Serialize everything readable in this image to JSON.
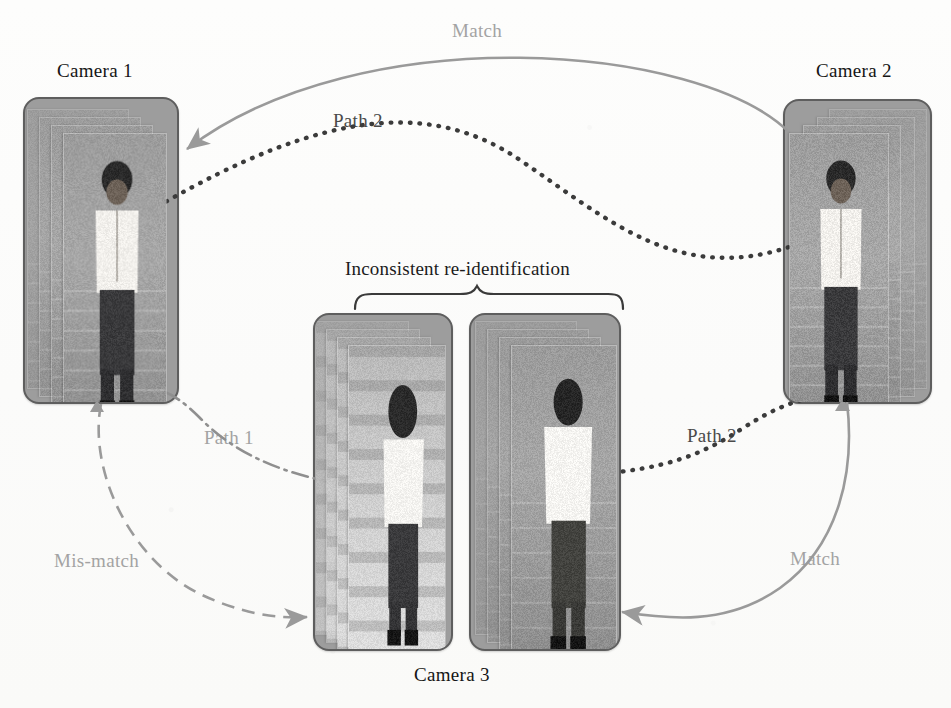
{
  "figure": {
    "background_color": "#fdfdfc"
  },
  "cameras": [
    {
      "id": "camera-1",
      "label": "Camera 1",
      "label_pos": "above",
      "frame_count": 4,
      "subject": "man in white shirt, frontal view"
    },
    {
      "id": "camera-2",
      "label": "Camera 2",
      "label_pos": "above",
      "frame_count": 4,
      "subject": "man in white shirt, frontal view"
    },
    {
      "id": "camera-3",
      "label": "Camera 3",
      "label_pos": "below",
      "frame_count": 4,
      "subject": "two tracklets: woman rear view and man rear view"
    }
  ],
  "panels": [
    {
      "name": "camera-1-panel",
      "camera": "Camera 1"
    },
    {
      "name": "camera-2-panel",
      "camera": "Camera 2"
    },
    {
      "name": "camera-3-panel-a",
      "camera": "Camera 3"
    },
    {
      "name": "camera-3-panel-b",
      "camera": "Camera 3"
    }
  ],
  "annotations": {
    "brace_label": "Inconsistent re-identification",
    "edges": [
      {
        "name": "match-top",
        "label": "Match",
        "style": "solid",
        "color": "#9a9a9a",
        "from": "Camera 2",
        "to": "Camera 1"
      },
      {
        "name": "path2-top",
        "label": "Path 2",
        "style": "dotted",
        "color": "#3b3b3b",
        "from": "Camera 1",
        "to": "Camera 2"
      },
      {
        "name": "path1",
        "label": "Path 1",
        "style": "dash-dot",
        "color": "#8f8f8f",
        "from": "Camera 3 (a)",
        "to": "Camera 1"
      },
      {
        "name": "mis-match",
        "label": "Mis-match",
        "style": "dashed",
        "color": "#9a9a9a",
        "from": "Camera 1",
        "to": "Camera 3 (a)"
      },
      {
        "name": "path2-bottom",
        "label": "Path 2",
        "style": "dotted",
        "color": "#3b3b3b",
        "from": "Camera 3 (b)",
        "to": "Camera 2"
      },
      {
        "name": "match-bottom",
        "label": "Match",
        "style": "solid",
        "color": "#9a9a9a",
        "from": "Camera 2",
        "to": "Camera 3 (b)"
      }
    ]
  },
  "colors": {
    "panel_fill": "#9d9d9d",
    "panel_stroke": "#5e5e5e",
    "match_arrow": "#9a9a9a",
    "path_dotted": "#3b3b3b",
    "path1_dashdot": "#8f8f8f",
    "mismatch_dashed": "#9a9a9a",
    "text_dark": "#151515",
    "text_gray": "#a3a3a3"
  }
}
